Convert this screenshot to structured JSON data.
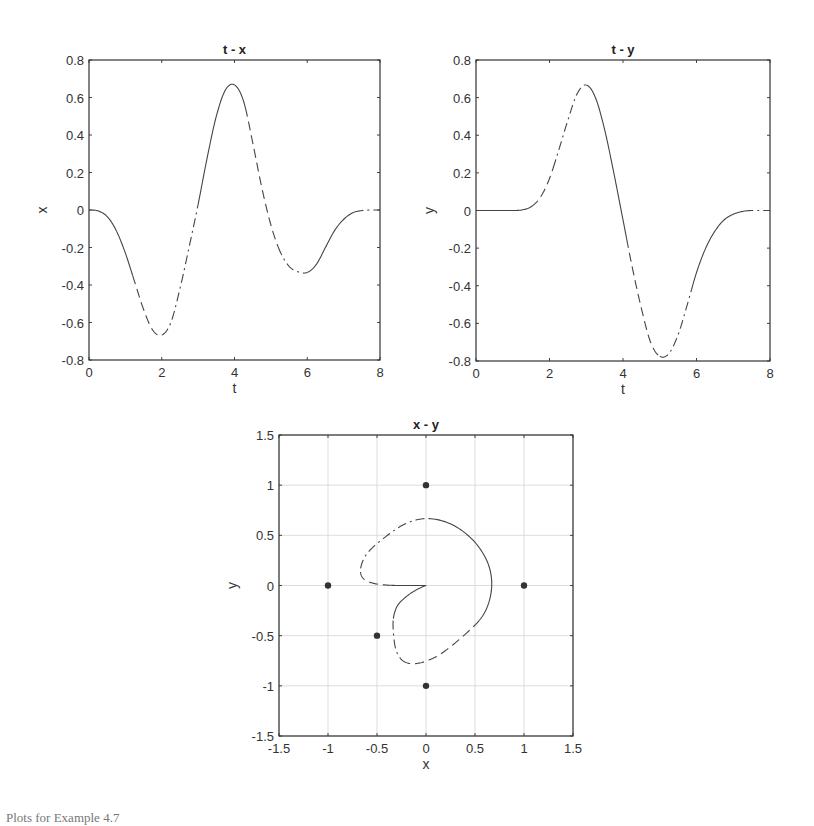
{
  "chart_data": [
    {
      "id": "tx",
      "type": "line",
      "title": "t - x",
      "xlabel": "t",
      "ylabel": "x",
      "xlim": [
        0,
        8
      ],
      "ylim": [
        -0.8,
        0.8
      ],
      "xticks": [
        0,
        2,
        4,
        6,
        8
      ],
      "yticks": [
        -0.8,
        -0.6,
        -0.4,
        -0.2,
        0,
        0.2,
        0.4,
        0.6,
        0.8
      ],
      "xtick_labels": [
        "0",
        "2",
        "4",
        "6",
        "8"
      ],
      "ytick_labels": [
        "-0.8",
        "-0.6",
        "-0.4",
        "-0.2",
        "0",
        "0.2",
        "0.4",
        "0.6",
        "0.8"
      ],
      "grid": false,
      "frame": {
        "left": 89,
        "top": 60,
        "right": 380,
        "bottom": 360
      },
      "series": [
        {
          "name": "x(t)",
          "t": [
            0,
            0.25,
            0.5,
            0.75,
            1.0,
            1.25,
            1.5,
            1.75,
            2.0,
            2.25,
            2.5,
            2.75,
            3.0,
            3.25,
            3.5,
            3.75,
            4.0,
            4.25,
            4.5,
            4.75,
            5.0,
            5.25,
            5.5,
            5.75,
            6.0,
            6.25,
            6.5,
            6.75,
            7.0,
            7.25,
            7.5,
            7.75,
            8.0
          ],
          "values": [
            0,
            -0.005,
            -0.035,
            -0.11,
            -0.23,
            -0.38,
            -0.53,
            -0.64,
            -0.667,
            -0.6,
            -0.42,
            -0.2,
            0.03,
            0.28,
            0.5,
            0.64,
            0.667,
            0.58,
            0.36,
            0.12,
            -0.08,
            -0.22,
            -0.3,
            -0.33,
            -0.333,
            -0.29,
            -0.2,
            -0.11,
            -0.05,
            -0.015,
            -0.003,
            0,
            0
          ]
        }
      ],
      "segments": [
        {
          "from": 0,
          "to": 1.2,
          "style": "solid"
        },
        {
          "from": 1.2,
          "to": 2.0,
          "style": "dashed"
        },
        {
          "from": 2.0,
          "to": 3.0,
          "style": "dashdot"
        },
        {
          "from": 3.0,
          "to": 4.3,
          "style": "solid"
        },
        {
          "from": 4.3,
          "to": 5.2,
          "style": "dashed"
        },
        {
          "from": 5.2,
          "to": 6.0,
          "style": "dashdot"
        },
        {
          "from": 6.0,
          "to": 7.3,
          "style": "solid"
        },
        {
          "from": 7.3,
          "to": 8.0,
          "style": "dashdot"
        }
      ]
    },
    {
      "id": "ty",
      "type": "line",
      "title": "t - y",
      "xlabel": "t",
      "ylabel": "y",
      "xlim": [
        0,
        8
      ],
      "ylim": [
        -0.8,
        0.8
      ],
      "xticks": [
        0,
        2,
        4,
        6,
        8
      ],
      "yticks": [
        -0.8,
        -0.6,
        -0.4,
        -0.2,
        0,
        0.2,
        0.4,
        0.6,
        0.8
      ],
      "xtick_labels": [
        "0",
        "2",
        "4",
        "6",
        "8"
      ],
      "ytick_labels": [
        "-0.8",
        "-0.6",
        "-0.4",
        "-0.2",
        "0",
        "0.2",
        "0.4",
        "0.6",
        "0.8"
      ],
      "grid": false,
      "frame": {
        "left": 476,
        "top": 60,
        "right": 770,
        "bottom": 361
      },
      "series": [
        {
          "name": "y(t)",
          "t": [
            0,
            0.25,
            0.5,
            0.75,
            1.0,
            1.25,
            1.5,
            1.75,
            2.0,
            2.25,
            2.5,
            2.75,
            3.0,
            3.25,
            3.5,
            3.75,
            4.0,
            4.25,
            4.5,
            4.75,
            5.0,
            5.25,
            5.5,
            5.75,
            6.0,
            6.25,
            6.5,
            6.75,
            7.0,
            7.25,
            7.5,
            7.75,
            8.0
          ],
          "values": [
            0,
            0,
            0,
            0,
            0,
            0.003,
            0.02,
            0.07,
            0.17,
            0.32,
            0.48,
            0.62,
            0.667,
            0.6,
            0.43,
            0.2,
            -0.05,
            -0.3,
            -0.52,
            -0.7,
            -0.775,
            -0.76,
            -0.66,
            -0.5,
            -0.33,
            -0.2,
            -0.11,
            -0.05,
            -0.02,
            -0.005,
            0,
            0,
            0
          ]
        }
      ],
      "segments": [
        {
          "from": 0,
          "to": 1.5,
          "style": "solid"
        },
        {
          "from": 1.5,
          "to": 2.1,
          "style": "dashed"
        },
        {
          "from": 2.1,
          "to": 3.0,
          "style": "dashdot"
        },
        {
          "from": 3.0,
          "to": 4.1,
          "style": "solid"
        },
        {
          "from": 4.1,
          "to": 5.0,
          "style": "dashed"
        },
        {
          "from": 5.0,
          "to": 5.9,
          "style": "dashdot"
        },
        {
          "from": 5.9,
          "to": 7.3,
          "style": "solid"
        },
        {
          "from": 7.3,
          "to": 8.0,
          "style": "dashdot"
        }
      ]
    },
    {
      "id": "xy",
      "type": "line",
      "title": "x - y",
      "xlabel": "x",
      "ylabel": "y",
      "xlim": [
        -1.5,
        1.5
      ],
      "ylim": [
        -1.5,
        1.5
      ],
      "xticks": [
        -1.5,
        -1,
        -0.5,
        0,
        0.5,
        1,
        1.5
      ],
      "yticks": [
        -1.5,
        -1,
        -0.5,
        0,
        0.5,
        1,
        1.5
      ],
      "xtick_labels": [
        "-1.5",
        "-1",
        "-0.5",
        "0",
        "0.5",
        "1",
        "1.5"
      ],
      "ytick_labels": [
        "-1.5",
        "-1",
        "-0.5",
        "0",
        "0.5",
        "1",
        "1.5"
      ],
      "grid": true,
      "frame": {
        "left": 279,
        "top": 435,
        "right": 573,
        "bottom": 736
      },
      "series": [
        {
          "name": "trajectory (x(t), y(t))",
          "source": [
            "tx",
            "ty"
          ]
        }
      ],
      "markers": {
        "name": "obstacle points",
        "points": [
          [
            0,
            1
          ],
          [
            -1,
            0
          ],
          [
            1,
            0
          ],
          [
            -0.5,
            -0.5
          ],
          [
            0,
            -1
          ]
        ]
      }
    }
  ],
  "caption": "Plots for Example 4.7"
}
